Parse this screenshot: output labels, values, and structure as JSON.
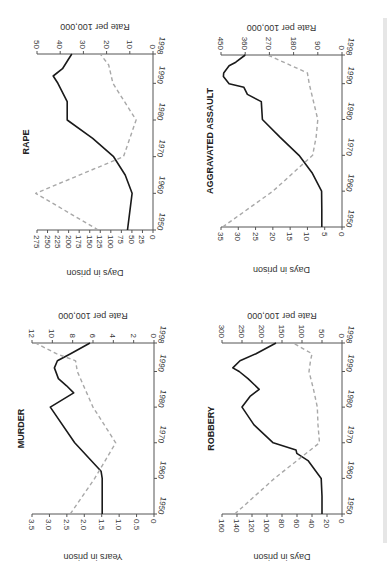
{
  "figure": {
    "orientation": "rotated-90-ccw",
    "colors": {
      "rate_line": "#1a1a1a",
      "days_line": "#a8a8a8",
      "axis": "#555555",
      "text": "#333333"
    }
  },
  "chart_data": [
    {
      "type": "line",
      "title": "RAPE",
      "xlabel": "",
      "x_ticks": [
        1950,
        1960,
        1970,
        1980,
        1990,
        1998
      ],
      "ylabel_left": "Days in prison",
      "ylabel_right": "Rate per 100,000",
      "ylim_left": [
        0,
        275
      ],
      "ylim_right": [
        0,
        50
      ],
      "y_ticks_left": [
        0,
        25,
        50,
        75,
        100,
        125,
        150,
        175,
        200,
        225,
        250,
        275
      ],
      "y_ticks_right": [
        0,
        10,
        20,
        30,
        40,
        50
      ],
      "grid": false,
      "series": [
        {
          "name": "Rate per 100,000",
          "axis": "right",
          "style": "solid",
          "x": [
            1950,
            1955,
            1960,
            1965,
            1970,
            1975,
            1980,
            1985,
            1990,
            1992,
            1994,
            1996,
            1998
          ],
          "values": [
            11,
            10,
            9,
            12,
            17,
            26,
            37,
            37,
            41,
            43,
            39,
            37,
            35
          ]
        },
        {
          "name": "Days in prison",
          "axis": "left",
          "style": "dashed",
          "x": [
            1950,
            1960,
            1970,
            1980,
            1990,
            1995,
            1998
          ],
          "values": [
            130,
            278,
            70,
            40,
            95,
            105,
            125
          ]
        }
      ]
    },
    {
      "type": "line",
      "title": "AGGRAVATED ASSAULT",
      "xlabel": "",
      "x_ticks": [
        1950,
        1960,
        1970,
        1980,
        1990,
        1998
      ],
      "ylabel_left": "Days in prison",
      "ylabel_right": "Rate per 100,000",
      "ylim_left": [
        0,
        35
      ],
      "ylim_right": [
        0,
        450
      ],
      "y_ticks_left": [
        0,
        5,
        10,
        15,
        20,
        25,
        30,
        35
      ],
      "y_ticks_right": [
        0,
        90,
        180,
        270,
        360,
        450
      ],
      "grid": false,
      "series": [
        {
          "name": "Rate per 100,000",
          "axis": "right",
          "style": "solid",
          "x": [
            1950,
            1955,
            1960,
            1965,
            1970,
            1975,
            1980,
            1985,
            1987,
            1989,
            1990,
            1992,
            1993,
            1995,
            1996,
            1998
          ],
          "values": [
            75,
            75,
            76,
            110,
            160,
            230,
            296,
            300,
            352,
            365,
            420,
            441,
            440,
            420,
            395,
            360
          ]
        },
        {
          "name": "Days in prison",
          "axis": "left",
          "style": "dashed",
          "x": [
            1950,
            1960,
            1970,
            1975,
            1980,
            1990,
            1993,
            1998
          ],
          "values": [
            34.5,
            20,
            8.5,
            7.5,
            7,
            9.5,
            10,
            21.5
          ]
        }
      ]
    },
    {
      "type": "line",
      "title": "MURDER",
      "xlabel": "",
      "x_ticks": [
        1950,
        1960,
        1970,
        1980,
        1990,
        1998
      ],
      "ylabel_left": "Years in prison",
      "ylabel_right": "Rate per 100,000",
      "ylim_left": [
        0,
        3.5
      ],
      "ylim_right": [
        0,
        12
      ],
      "y_ticks_left": [
        "0",
        "0.5",
        "1.0",
        "1.5",
        "2.0",
        "2.5",
        "3.0",
        "3.5"
      ],
      "y_ticks_right": [
        0,
        2,
        4,
        6,
        8,
        10,
        12
      ],
      "grid": false,
      "series": [
        {
          "name": "Rate per 100,000",
          "axis": "right",
          "style": "solid",
          "x": [
            1950,
            1955,
            1960,
            1962,
            1970,
            1980,
            1984,
            1986,
            1988,
            1991,
            1993,
            1995,
            1998
          ],
          "values": [
            5.1,
            5.1,
            5.1,
            5.2,
            7.8,
            10.2,
            7.9,
            8.6,
            9.4,
            9.8,
            9.5,
            8.2,
            6.3
          ]
        },
        {
          "name": "Years in prison",
          "axis": "left",
          "style": "dashed",
          "x": [
            1950,
            1960,
            1970,
            1980,
            1990,
            1993,
            1995,
            1998
          ],
          "values": [
            2.4,
            1.7,
            1.1,
            1.75,
            2.2,
            2.25,
            2.8,
            3.4
          ]
        }
      ]
    },
    {
      "type": "line",
      "title": "ROBBERY",
      "xlabel": "",
      "x_ticks": [
        1950,
        1960,
        1970,
        1980,
        1990,
        1998
      ],
      "ylabel_left": "Days in prison",
      "ylabel_right": "Rate per 100,000",
      "ylim_left": [
        0,
        160
      ],
      "ylim_right": [
        0,
        300
      ],
      "y_ticks_left": [
        0,
        20,
        40,
        60,
        80,
        100,
        120,
        140,
        160
      ],
      "y_ticks_right": [
        0,
        50,
        100,
        150,
        200,
        250,
        300
      ],
      "grid": false,
      "series": [
        {
          "name": "Rate per 100,000",
          "axis": "right",
          "style": "solid",
          "x": [
            1950,
            1955,
            1960,
            1965,
            1967,
            1968,
            1970,
            1975,
            1980,
            1983,
            1985,
            1988,
            1990,
            1991,
            1993,
            1995,
            1998
          ],
          "values": [
            50,
            50,
            52,
            85,
            113,
            115,
            172,
            220,
            250,
            230,
            207,
            235,
            257,
            273,
            255,
            215,
            165
          ]
        },
        {
          "name": "Days in prison",
          "axis": "left",
          "style": "dashed",
          "x": [
            1950,
            1960,
            1970,
            1975,
            1980,
            1985,
            1990,
            1993,
            1995,
            1998
          ],
          "values": [
            143,
            90,
            30,
            32,
            33,
            38,
            44,
            42,
            40,
            65
          ]
        }
      ]
    }
  ]
}
